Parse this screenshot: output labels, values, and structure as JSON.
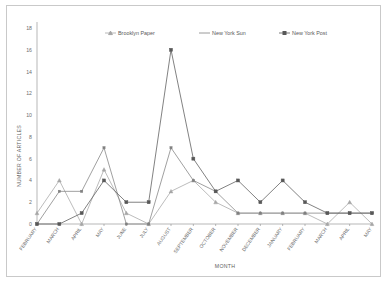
{
  "chart_data": {
    "type": "line",
    "title": "",
    "xlabel": "MONTH",
    "ylabel": "NUMBER OF ARTICLES",
    "ylim": [
      0,
      18
    ],
    "yticks": [
      0,
      2,
      4,
      6,
      8,
      10,
      12,
      14,
      16,
      18
    ],
    "grid": false,
    "legend_position": "top",
    "categories": [
      "FEBRUARY",
      "MARCH",
      "APRIL",
      "MAY",
      "JUNE",
      "JULY",
      "AUGUST",
      "SEPTEMBER",
      "OCTOBER",
      "NOVEMBER",
      "DECEMBER",
      "JANUARY",
      "FEBRUARY",
      "MARCH",
      "APRIL",
      "MAY"
    ],
    "series": [
      {
        "name": "Brooklyn Paper",
        "color": "#a6a6a6",
        "marker": "triangle",
        "values": [
          1,
          4,
          0,
          5,
          1,
          0,
          3,
          4,
          2,
          1,
          1,
          1,
          1,
          0,
          2,
          0
        ]
      },
      {
        "name": "New York Sun",
        "color": "#808080",
        "marker": "none",
        "values": [
          0,
          3,
          3,
          7,
          0,
          0,
          7,
          4,
          3,
          1,
          1,
          1,
          1,
          1,
          1,
          1
        ]
      },
      {
        "name": "New York Post",
        "color": "#585858",
        "marker": "square",
        "values": [
          0,
          0,
          1,
          4,
          2,
          2,
          16,
          6,
          3,
          4,
          2,
          4,
          2,
          1,
          1,
          1
        ]
      }
    ]
  },
  "legend": {
    "entries": [
      {
        "label": "Brooklyn Paper"
      },
      {
        "label": "New York Sun"
      },
      {
        "label": "New York Post"
      }
    ]
  },
  "axes": {
    "y_title": "NUMBER OF ARTICLES",
    "x_title": "MONTH",
    "y_tick_labels": [
      "18",
      "16",
      "14",
      "12",
      "10",
      "8",
      "6",
      "4",
      "2",
      "0"
    ]
  }
}
